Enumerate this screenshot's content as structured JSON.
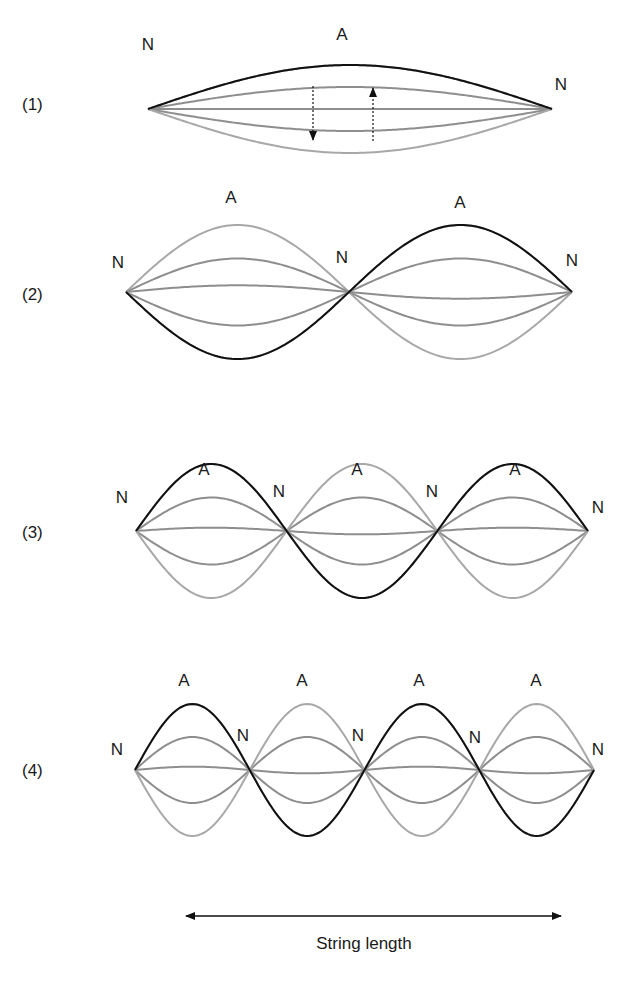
{
  "colors": {
    "highlight_curve": "#111111",
    "light_curve": "#a8a8a8",
    "mid_curve": "#8e8e8e",
    "text": "#1a1a1a"
  },
  "node_label": "N",
  "antinode_label": "A",
  "axis": {
    "label": "String length",
    "arrow": "double-headed"
  },
  "panels": [
    {
      "id": "1",
      "label": "(1)",
      "harmonic": 1,
      "nodes": 2,
      "antinodes": 1,
      "amplitudes": [
        1.0,
        0.5,
        0.0,
        -0.5,
        -1.0
      ],
      "highlight": "top",
      "arrows": [
        {
          "direction": "down",
          "style": "dashed"
        },
        {
          "direction": "up",
          "style": "dashed"
        }
      ]
    },
    {
      "id": "2",
      "label": "(2)",
      "harmonic": 2,
      "nodes": 3,
      "antinodes": 2,
      "amplitudes": [
        1.0,
        0.5,
        0.1,
        -0.5,
        -1.0
      ],
      "highlight": "bottom-first"
    },
    {
      "id": "3",
      "label": "(3)",
      "harmonic": 3,
      "nodes": 4,
      "antinodes": 3,
      "amplitudes": [
        1.0,
        0.5,
        0.05,
        -0.5,
        -1.0
      ],
      "highlight": "top-first"
    },
    {
      "id": "4",
      "label": "(4)",
      "harmonic": 4,
      "nodes": 5,
      "antinodes": 4,
      "amplitudes": [
        1.0,
        0.5,
        0.05,
        -0.5,
        -1.0
      ],
      "highlight": "top-first"
    }
  ]
}
